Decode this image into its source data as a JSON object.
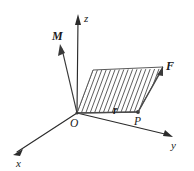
{
  "figure": {
    "background_color": "#ffffff",
    "ink_color": "#2b2b2b",
    "width": 194,
    "height": 171
  },
  "axes": [
    {
      "id": "z",
      "label": "z",
      "style": "italic",
      "direction": "up",
      "origin": [
        77,
        113
      ],
      "tip": [
        78,
        15
      ],
      "label_pos": [
        84,
        13
      ]
    },
    {
      "id": "x",
      "label": "x",
      "style": "italic",
      "direction": "lower-left",
      "origin": [
        77,
        113
      ],
      "tip": [
        14,
        154
      ],
      "label_pos": [
        16,
        158
      ]
    },
    {
      "id": "y",
      "label": "y",
      "style": "italic",
      "direction": "lower-right",
      "origin": [
        77,
        113
      ],
      "tip": [
        173,
        137
      ],
      "label_pos": [
        171,
        140
      ]
    }
  ],
  "vectors": [
    {
      "id": "M",
      "label": "M",
      "style": "bold-italic",
      "origin": [
        77,
        113
      ],
      "tip": [
        60,
        45
      ],
      "label_pos": [
        52,
        30
      ]
    },
    {
      "id": "F",
      "label": "F",
      "style": "bold-italic",
      "origin": [
        138,
        112
      ],
      "tip": [
        163,
        67
      ],
      "label_pos": [
        166,
        60
      ]
    },
    {
      "id": "r",
      "label": "r",
      "style": "bold-italic",
      "origin": [
        77,
        113
      ],
      "tip": [
        138,
        112
      ],
      "label_pos": [
        113,
        105
      ]
    }
  ],
  "points": [
    {
      "id": "O",
      "label": "O",
      "style": "italic",
      "pos": [
        77,
        113
      ],
      "label_pos": [
        70,
        118
      ]
    },
    {
      "id": "P",
      "label": "P",
      "style": "italic",
      "pos": [
        138,
        112
      ],
      "label_pos": [
        134,
        116
      ]
    }
  ],
  "parallelogram": {
    "name": "moment-area",
    "fill": "none",
    "hatch_color": "#555555",
    "hatch_spacing": 4.4,
    "vertices": [
      [
        77,
        113
      ],
      [
        138,
        112
      ],
      [
        163,
        67
      ],
      [
        93,
        70
      ]
    ]
  }
}
